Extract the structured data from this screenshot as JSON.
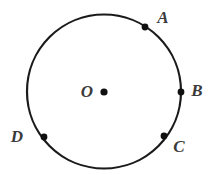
{
  "figure": {
    "type": "geometry-diagram",
    "shape": "circle",
    "background_color": "#ffffff",
    "stroke_color": "#1a1a1a",
    "label_color": "#3a3a3a",
    "circle": {
      "center_x": 104,
      "center_y": 91.5,
      "radius": 77,
      "stroke_width": 2.2,
      "fill": "none"
    },
    "center_point": {
      "name": "O",
      "label": "O",
      "dot_x": 104,
      "dot_y": 92,
      "dot_radius": 3.6,
      "label_x": 87,
      "label_y": 91
    },
    "points": [
      {
        "name": "A",
        "label": "A",
        "dot_x": 145,
        "dot_y": 27,
        "dot_radius": 3.4,
        "label_x": 163,
        "label_y": 17
      },
      {
        "name": "B",
        "label": "B",
        "dot_x": 181,
        "dot_y": 92,
        "dot_radius": 3.4,
        "label_x": 197,
        "label_y": 90
      },
      {
        "name": "C",
        "label": "C",
        "dot_x": 164,
        "dot_y": 136,
        "dot_radius": 3.4,
        "label_x": 179,
        "label_y": 146
      },
      {
        "name": "D",
        "label": "D",
        "dot_x": 44,
        "dot_y": 137,
        "dot_radius": 3.4,
        "label_x": 17,
        "label_y": 136
      }
    ]
  }
}
